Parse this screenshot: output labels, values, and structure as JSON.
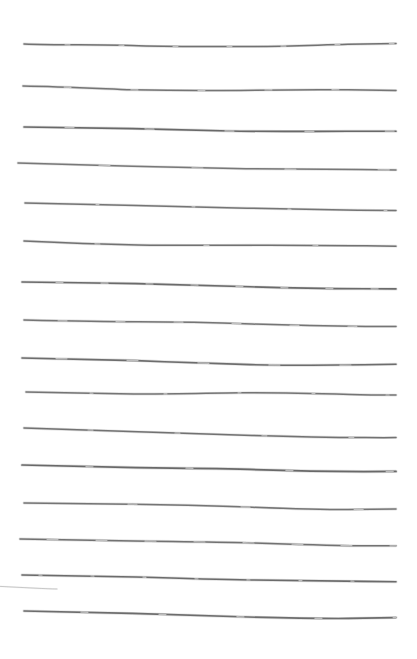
{
  "document": {
    "kind": "hand-drawn-ruled-paper",
    "title": "Hand-drawn ruled lines sheet",
    "caption": "",
    "width": 417,
    "height": 659,
    "background_color": "#ffffff",
    "ink_color": "#5a5a5a",
    "text_content": "",
    "line_count": 17,
    "full_line_count": 16,
    "partial_line_count": 1,
    "nominal_left_x": 24,
    "nominal_right_x": 396,
    "nominal_spacing": 37
  },
  "lines": [
    {
      "id": "line-01",
      "index": 1,
      "type": "full",
      "y": 45,
      "x_start": 24,
      "x_end": 396,
      "stroke_width": 1.5,
      "opacity": 0.82,
      "color": "#5a5a5a",
      "path": "M24,44 C60,45.5 96,44.2 132,45.6 C168,47 204,46.4 240,46.6 C276,46.8 312,45.2 348,44.3 C366,43.9 382,43.7 396,43.6"
    },
    {
      "id": "line-02",
      "index": 2,
      "type": "full",
      "y": 87,
      "x_start": 23,
      "x_end": 396,
      "stroke_width": 1.5,
      "opacity": 0.8,
      "color": "#5a5a5a",
      "path": "M23,86 C60,86.6 96,88.4 132,89.8 C168,90.6 204,90.8 240,90.4 C276,89.8 312,89.4 348,89.8 C366,90 382,90.3 396,90.5"
    },
    {
      "id": "line-03",
      "index": 3,
      "type": "full",
      "y": 127,
      "x_start": 24,
      "x_end": 396,
      "stroke_width": 1.6,
      "opacity": 0.85,
      "color": "#555555",
      "path": "M24,127 C60,127.4 96,127.8 132,128.6 C168,129.6 204,130.6 240,131.2 C276,131.6 312,131.4 348,131.2 C366,131.1 382,131.1 396,131.2"
    },
    {
      "id": "line-04",
      "index": 4,
      "type": "full",
      "y": 163,
      "x_start": 18,
      "x_end": 396,
      "stroke_width": 1.5,
      "opacity": 0.78,
      "color": "#5a5a5a",
      "path": "M18,163 C56,164 94,165 132,166.2 C170,167.2 208,168.2 246,168.8 C284,169.2 322,169.4 360,169.6 C374,169.7 386,169.8 396,169.9"
    },
    {
      "id": "line-05",
      "index": 5,
      "type": "full",
      "y": 203,
      "x_start": 25,
      "x_end": 396,
      "stroke_width": 1.5,
      "opacity": 0.8,
      "color": "#5a5a5a",
      "path": "M25,203 C62,203.8 99,204.6 136,205.4 C173,206.2 210,207.2 247,208.2 C284,209.2 321,209.8 358,210.2 C372,210.4 386,210.5 396,210.6"
    },
    {
      "id": "line-06",
      "index": 6,
      "type": "full",
      "y": 242,
      "x_start": 24,
      "x_end": 396,
      "stroke_width": 1.5,
      "opacity": 0.82,
      "color": "#5a5a5a",
      "path": "M24,241 C62,242.8 100,244.2 138,245 C176,245.6 214,245.4 252,245.2 C290,245 328,245.4 366,245.8 C378,246 390,246.1 396,246.2"
    },
    {
      "id": "line-07",
      "index": 7,
      "type": "full",
      "y": 282,
      "x_start": 22,
      "x_end": 396,
      "stroke_width": 1.6,
      "opacity": 0.84,
      "color": "#555555",
      "path": "M22,282 C60,282.6 98,283 136,283.6 C174,284.4 212,285.6 250,286.8 C288,288 326,288.6 364,288.8 C378,288.9 390,288.9 396,288.9"
    },
    {
      "id": "line-08",
      "index": 8,
      "type": "full",
      "y": 320,
      "x_start": 24,
      "x_end": 396,
      "stroke_width": 1.5,
      "opacity": 0.8,
      "color": "#5a5a5a",
      "path": "M24,320 C62,320.8 100,321.6 138,321.8 C176,321.8 214,322.6 252,324 C290,325.4 328,326.2 366,326.4 C378,326.4 390,326.4 396,326.4"
    },
    {
      "id": "line-09",
      "index": 9,
      "type": "full",
      "y": 358,
      "x_start": 22,
      "x_end": 396,
      "stroke_width": 1.6,
      "opacity": 0.83,
      "color": "#555555",
      "path": "M22,358 C60,358.6 98,359.4 136,360.6 C174,362 212,363.6 250,364.6 C288,365.4 326,365.4 364,364.8 C378,364.5 390,364.3 396,364.2"
    },
    {
      "id": "line-10",
      "index": 10,
      "type": "full",
      "y": 392,
      "x_start": 26,
      "x_end": 396,
      "stroke_width": 1.5,
      "opacity": 0.8,
      "color": "#5a5a5a",
      "path": "M26,392 C62,392.4 98,393.4 134,394 C170,394.2 206,393.2 242,392.8 C278,392.6 314,393.4 350,394.4 C366,394.8 384,395 396,395.1"
    },
    {
      "id": "line-11",
      "index": 11,
      "type": "full",
      "y": 428,
      "x_start": 24,
      "x_end": 396,
      "stroke_width": 1.5,
      "opacity": 0.82,
      "color": "#5a5a5a",
      "path": "M24,428 C62,429 100,430.4 138,431.8 C176,433 214,434.2 252,435.4 C290,436.6 328,437.4 366,437.6 C378,437.7 390,437.7 396,437.6"
    },
    {
      "id": "line-12",
      "index": 12,
      "type": "full",
      "y": 465,
      "x_start": 22,
      "x_end": 396,
      "stroke_width": 1.7,
      "opacity": 0.85,
      "color": "#555555",
      "path": "M22,465 C60,466 98,467 136,467.6 C174,468 212,468.4 250,469.4 C288,470.6 326,471.4 364,471.6 C378,471.6 390,471.5 396,471.4"
    },
    {
      "id": "line-13",
      "index": 13,
      "type": "full",
      "y": 505,
      "x_start": 24,
      "x_end": 396,
      "stroke_width": 1.5,
      "opacity": 0.8,
      "color": "#5a5a5a",
      "path": "M24,503 C60,503.4 96,503.8 132,504.2 C168,504.6 204,505.4 240,506.8 C276,508.2 312,509.6 348,509.6 C366,509.5 384,509.2 396,509"
    },
    {
      "id": "line-14",
      "index": 14,
      "type": "full",
      "y": 540,
      "x_start": 20,
      "x_end": 396,
      "stroke_width": 1.5,
      "opacity": 0.82,
      "color": "#5a5a5a",
      "path": "M20,539 C58,539.6 96,540.4 134,541 C172,541.6 210,541.8 248,542.8 C286,544.2 324,545.4 362,545.8 C376,545.9 389,545.9 396,545.8"
    },
    {
      "id": "line-15",
      "index": 15,
      "type": "full",
      "y": 575,
      "x_start": 22,
      "x_end": 396,
      "stroke_width": 1.6,
      "opacity": 0.84,
      "color": "#555555",
      "path": "M22,575 C60,575.4 98,576 136,577 C174,578.2 212,579.4 250,580 C288,580.4 326,580.8 364,581.4 C378,581.6 390,581.7 396,581.8"
    },
    {
      "id": "line-16",
      "index": 16,
      "type": "partial",
      "y": 588,
      "x_start": 0,
      "x_end": 57,
      "stroke_width": 1.0,
      "opacity": 0.42,
      "color": "#8a8a8a",
      "path": "M0,586.4 C12,587 24,587.6 36,588.2 C44,588.6 51,588.9 57,589"
    },
    {
      "id": "line-17",
      "index": 17,
      "type": "full",
      "y": 613,
      "x_start": 24,
      "x_end": 396,
      "stroke_width": 1.6,
      "opacity": 0.83,
      "color": "#555555",
      "path": "M24,611 C60,611.6 96,612.4 132,613.4 C168,614.6 204,615.8 240,616.8 C276,617.8 312,618.6 348,618.4 C366,618.2 384,617.8 396,617.6"
    }
  ]
}
